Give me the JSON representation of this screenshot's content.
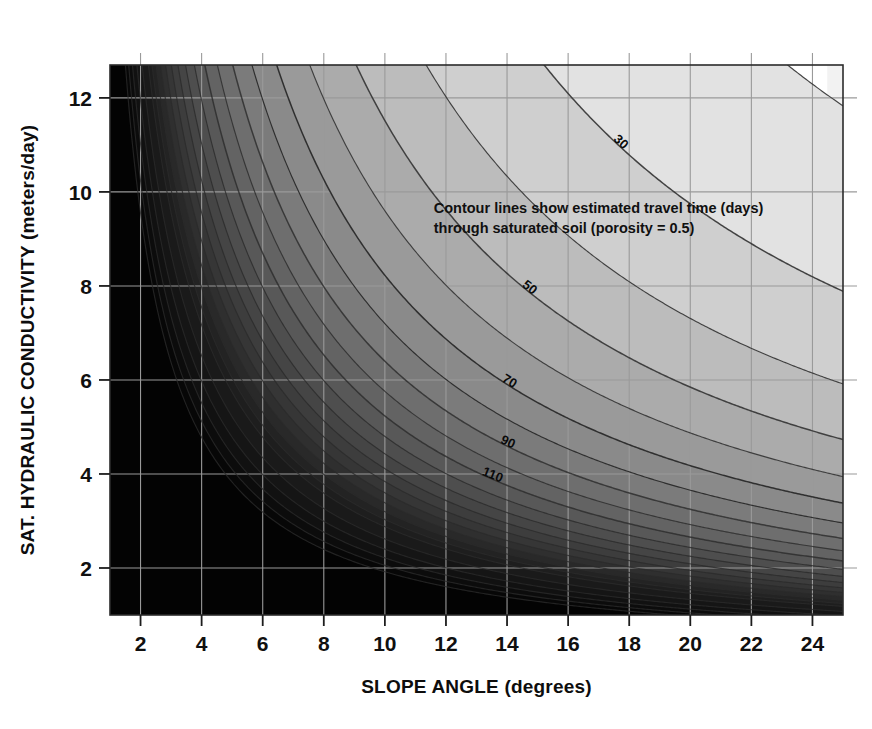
{
  "chart_data": {
    "type": "contour",
    "title": "",
    "xlabel": "SLOPE ANGLE (degrees)",
    "ylabel": "SAT. HYDRAULIC CONDUCTIVITY (meters/day)",
    "xlim": [
      1,
      25
    ],
    "ylim": [
      1,
      12.7
    ],
    "xticks": [
      2,
      4,
      6,
      8,
      10,
      12,
      14,
      16,
      18,
      20,
      22,
      24
    ],
    "yticks": [
      2,
      4,
      6,
      8,
      10,
      12
    ],
    "xtick_labels": [
      "2",
      "4",
      "6",
      "8",
      "10",
      "12",
      "14",
      "16",
      "18",
      "20",
      "22",
      "24"
    ],
    "ytick_labels": [
      "2",
      "4",
      "6",
      "8",
      "10",
      "12"
    ],
    "grid": true,
    "grid_color": "#9a9a9a",
    "legend": "none",
    "annotation": {
      "line1": "Contour lines show estimated travel time (days)",
      "line2": "through saturated soil (porosity = 0.5)",
      "x_data": 11.6,
      "y_data": 9.55
    },
    "contour_variable": "travel time (days)",
    "contour_levels": [
      10,
      20,
      30,
      40,
      50,
      60,
      70,
      80,
      90,
      100,
      110,
      120,
      130,
      140,
      150,
      160,
      170,
      180,
      190,
      200,
      220,
      240,
      260,
      280,
      300
    ],
    "labeled_levels": [
      10,
      30,
      50,
      70,
      90,
      110
    ],
    "contour_labels": [
      "10",
      "30",
      "50",
      "70",
      "90",
      "110"
    ],
    "formula": "t = C / (K * sin(theta))",
    "formula_constant": 100,
    "fill_colors": [
      "#ffffff",
      "#f2f2f2",
      "#e2e2e2",
      "#cfcfcf",
      "#bcbcbc",
      "#ababab",
      "#9a9a9a",
      "#8a8a8a",
      "#7b7b7b",
      "#6e6e6e",
      "#636363",
      "#585858",
      "#4e4e4e",
      "#454545",
      "#3d3d3d",
      "#363636",
      "#2f2f2f",
      "#292929",
      "#232323",
      "#1e1e1e",
      "#1a1a1a",
      "#151515",
      "#111111",
      "#0c0c0c",
      "#070707",
      "#030303"
    ],
    "line_color": "#3a3a3a",
    "axis_color": "#2b2b2b",
    "background": "#ffffff"
  },
  "axes": {
    "x_title": "SLOPE ANGLE (degrees)",
    "y_title": "SAT. HYDRAULIC CONDUCTIVITY (meters/day)"
  },
  "annotation": {
    "line1": "Contour lines show estimated travel time (days)",
    "line2": "through saturated soil (porosity = 0.5)"
  }
}
